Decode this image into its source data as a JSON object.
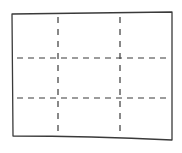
{
  "diagram": {
    "rows": 3,
    "columns": 3,
    "colors": {
      "background": "#ffffff",
      "stroke": "#3a3a3a"
    },
    "outline": {
      "top_left": [
        12,
        14
      ],
      "top_right": [
        172,
        12
      ],
      "bottom_right": [
        172,
        140
      ],
      "bottom_left": [
        13,
        136
      ]
    },
    "vertical_dividers_x": [
      58,
      120
    ],
    "horizontal_dividers_y": [
      58,
      98
    ]
  }
}
